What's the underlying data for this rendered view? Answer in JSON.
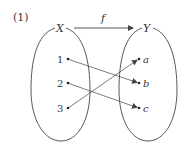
{
  "problem_label": "(1)",
  "function_label": "f",
  "domain_set": {
    "label": "X",
    "elements": [
      "1",
      "2",
      "3"
    ]
  },
  "codomain_set": {
    "label": "Y",
    "elements": [
      "a",
      "b",
      "c"
    ]
  },
  "mapping": [
    {
      "from": "1",
      "to": "b"
    },
    {
      "from": "2",
      "to": "c"
    },
    {
      "from": "3",
      "to": "a"
    }
  ],
  "colors": {
    "stroke": "#444444",
    "text": "#333333"
  }
}
